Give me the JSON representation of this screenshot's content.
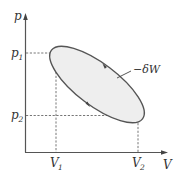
{
  "diagram": {
    "type": "pV-diagram",
    "axes": {
      "y_label": "p",
      "x_label": "V"
    },
    "ticks": {
      "p1": {
        "base": "p",
        "sub": "1"
      },
      "p2": {
        "base": "p",
        "sub": "2"
      },
      "V1": {
        "base": "V",
        "sub": "1"
      },
      "V2": {
        "base": "V",
        "sub": "2"
      }
    },
    "cycle": {
      "shape": "ellipse",
      "fill": "#eeeeee",
      "stroke": "#555555",
      "direction": "clockwise",
      "annotation": "−δW"
    },
    "colors": {
      "axis": "#555555",
      "dashed": "#666666",
      "text": "#333333"
    }
  }
}
